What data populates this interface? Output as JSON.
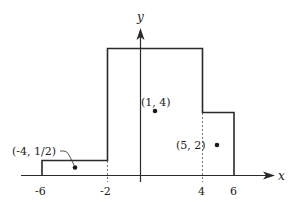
{
  "figure": {
    "type": "step-function piecewise-constant graph",
    "axes": {
      "x_label": "x",
      "y_label": "y"
    },
    "x_ticks": [
      "-6",
      "-2",
      "4",
      "6"
    ],
    "steps": [
      {
        "x_from": -6,
        "x_to": -2,
        "height": 0.5
      },
      {
        "x_from": -2,
        "x_to": 4,
        "height": 6
      },
      {
        "x_from": 4,
        "x_to": 6,
        "height": 3
      }
    ],
    "points": [
      {
        "label": "(-4, 1/2)",
        "x": -4,
        "y": 0.5
      },
      {
        "label": "(1, 4)",
        "x": 1,
        "y": 4
      },
      {
        "label": "(5, 2)",
        "x": 5,
        "y": 2
      }
    ],
    "colors": {
      "line": "#2a2a2a",
      "background": "#ffffff"
    }
  }
}
